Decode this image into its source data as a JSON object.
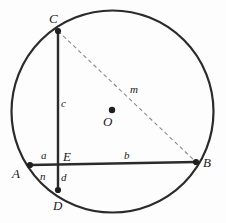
{
  "figure": {
    "type": "circle-geometry-diagram",
    "canvas": {
      "width": 226,
      "height": 223
    },
    "background_color": "#fdfdfd",
    "stroke_color": "#2b2b2b",
    "dashed_color": "#8a8a8a",
    "circle": {
      "name": "main-circle",
      "center": {
        "x": 112.5,
        "y": 111.5
      },
      "radius": 101,
      "stroke_width": 2.2
    },
    "center_dot": {
      "name": "center-point-O",
      "x": 112,
      "y": 110,
      "radius": 3.2
    },
    "points": [
      {
        "id": "C",
        "label": "C",
        "x": 58,
        "y": 31,
        "label_x": 49,
        "label_y": 12,
        "marker": true
      },
      {
        "id": "B",
        "label": "B",
        "x": 196,
        "y": 162,
        "label_x": 203,
        "label_y": 156,
        "marker": true
      },
      {
        "id": "A",
        "label": "A",
        "x": 30,
        "y": 165,
        "label_x": 12,
        "label_y": 167,
        "marker": true
      },
      {
        "id": "D",
        "label": "D",
        "x": 58,
        "y": 190,
        "label_x": 53,
        "label_y": 199,
        "marker": true
      },
      {
        "id": "E",
        "label": "E",
        "x": 58,
        "y": 162,
        "label_x": 63,
        "label_y": 150,
        "marker": false
      },
      {
        "id": "O",
        "label": "O",
        "x": 112,
        "y": 110,
        "label_x": 103,
        "label_y": 115,
        "marker": false
      }
    ],
    "chords": [
      {
        "name": "chord-CD",
        "from": "C",
        "to": "D",
        "x1": 58,
        "y1": 31,
        "x2": 58,
        "y2": 190,
        "style": "solid",
        "stroke_width": 2.4
      },
      {
        "name": "chord-AB",
        "from": "A",
        "to": "B",
        "x1": 30,
        "y1": 165,
        "x2": 196,
        "y2": 162,
        "style": "solid",
        "stroke_width": 2.4
      },
      {
        "name": "chord-CB",
        "from": "C",
        "to": "B",
        "x1": 58,
        "y1": 31,
        "x2": 196,
        "y2": 162,
        "style": "dashed",
        "stroke_width": 1.1,
        "dash_pattern": "4 3"
      }
    ],
    "segment_labels": [
      {
        "id": "c",
        "label": "c",
        "segment": "C-to-E",
        "x": 61,
        "y": 98
      },
      {
        "id": "a",
        "label": "a",
        "segment": "A-to-E",
        "x": 41,
        "y": 150
      },
      {
        "id": "b",
        "label": "b",
        "segment": "E-to-B",
        "x": 124,
        "y": 150
      },
      {
        "id": "d",
        "label": "d",
        "segment": "E-to-D",
        "x": 61,
        "y": 172
      },
      {
        "id": "n",
        "label": "n",
        "segment": "arc-A-to-D",
        "x": 40,
        "y": 171
      },
      {
        "id": "m",
        "label": "m",
        "segment": "C-to-B",
        "x": 130,
        "y": 84
      }
    ]
  }
}
